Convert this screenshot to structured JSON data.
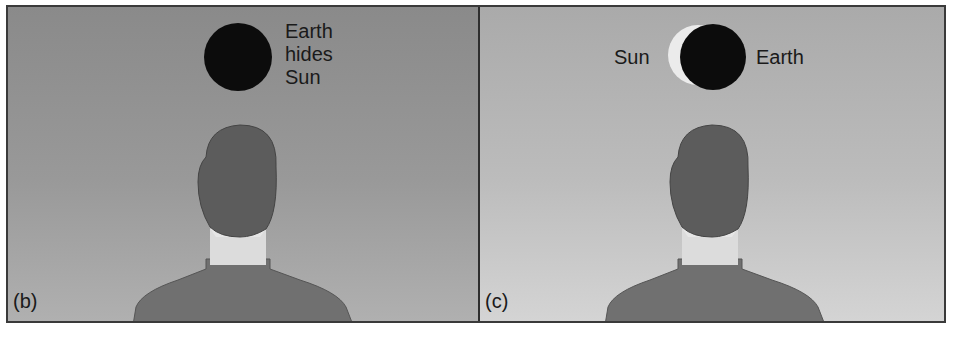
{
  "figure": {
    "panels": [
      {
        "id": "b",
        "tag": "(b)",
        "caption_lines": [
          "Earth",
          "hides",
          "Sun"
        ],
        "objects": [
          "earth-disk"
        ]
      },
      {
        "id": "c",
        "tag": "(c)",
        "sun_label": "Sun",
        "earth_label": "Earth",
        "objects": [
          "sun-crescent",
          "earth-disk"
        ]
      }
    ],
    "colors": {
      "earth": "#0c0c0c",
      "sun_crescent": "#f2f2f2",
      "head": "#5c5c5c",
      "neck": "#dcdcdc",
      "shirt": "#707070",
      "frame": "#3a3a3a"
    }
  }
}
